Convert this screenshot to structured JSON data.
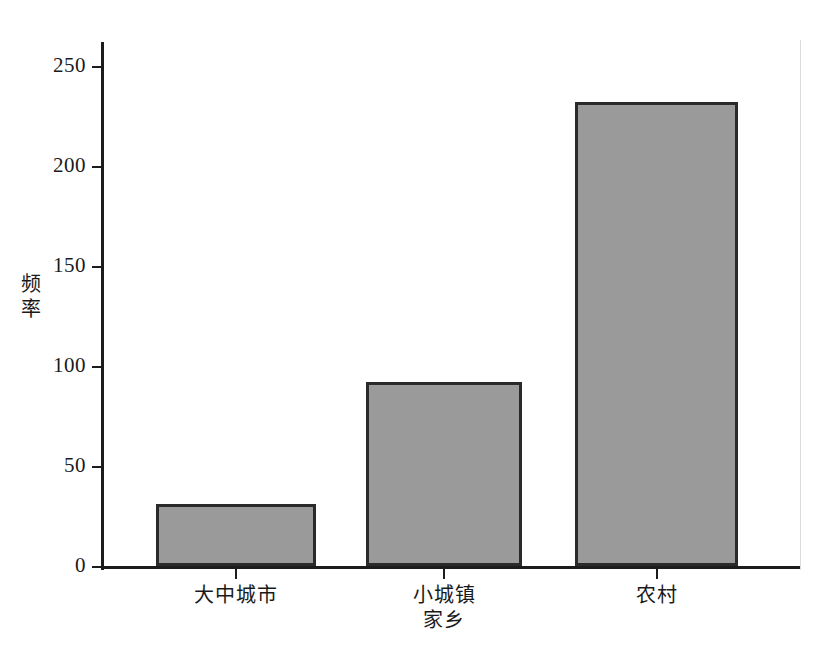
{
  "chart_data": {
    "type": "bar",
    "title": "",
    "xlabel": "家乡",
    "ylabel": "频率",
    "categories": [
      "大中城市",
      "小城镇",
      "农村"
    ],
    "values": [
      31,
      92,
      232
    ],
    "ylim": [
      0,
      250
    ],
    "yticks": [
      0,
      50,
      100,
      150,
      200,
      250
    ],
    "ytick_labels": [
      "0",
      "50",
      "100",
      "150",
      "200",
      "250"
    ],
    "grid": false,
    "legend": null,
    "bar_fill_color": "#9a9a9a",
    "bar_edge_color": "#2a2a2a",
    "axis_color": "#1c1c1c",
    "background_color": "#ffffff"
  },
  "axis_titles": {
    "y_char_1": "频",
    "y_char_2": "率",
    "x": "家乡"
  }
}
